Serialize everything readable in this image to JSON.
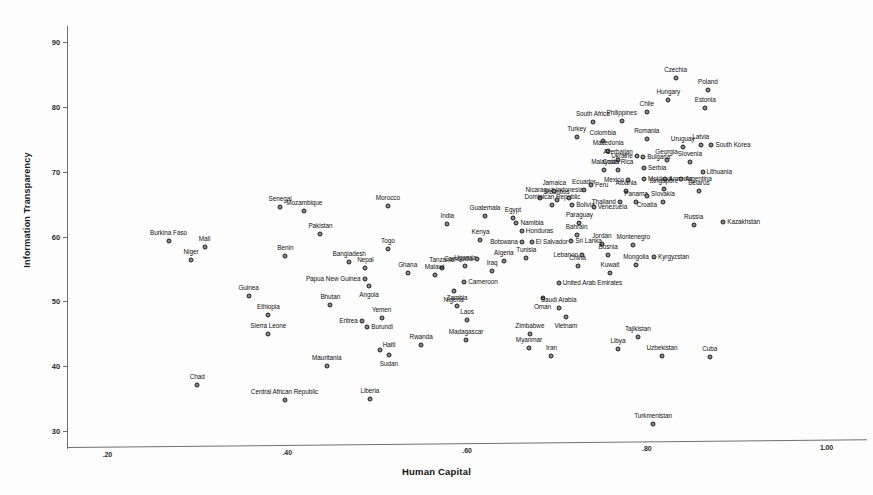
{
  "chart_data": {
    "type": "scatter",
    "title": "",
    "xlabel": "Human Capital",
    "ylabel": "Information Transparency",
    "xlim": [
      0.155,
      1.045
    ],
    "ylim": [
      27.5,
      92.5
    ],
    "xticks": [
      ".20",
      ".40",
      ".60",
      ".80",
      "1.00"
    ],
    "xtick_values": [
      0.2,
      0.4,
      0.6,
      0.8,
      1.0
    ],
    "yticks": [
      "90",
      "80",
      "70",
      "60",
      "50",
      "40",
      "30"
    ],
    "ytick_values": [
      90,
      80,
      70,
      60,
      50,
      40,
      30
    ],
    "grid": false,
    "legend": "none",
    "marker": "circle-filled-gray",
    "points": [
      {
        "label": "Burkina Faso",
        "x": 0.268,
        "y": 59.3,
        "pos": "top"
      },
      {
        "label": "Mali",
        "x": 0.308,
        "y": 58.4,
        "pos": "top"
      },
      {
        "label": "Niger",
        "x": 0.293,
        "y": 56.3,
        "pos": "top"
      },
      {
        "label": "Chad",
        "x": 0.3,
        "y": 37.0,
        "pos": "top"
      },
      {
        "label": "Guinea",
        "x": 0.357,
        "y": 50.8,
        "pos": "top"
      },
      {
        "label": "Ethiopia",
        "x": 0.379,
        "y": 47.9,
        "pos": "top"
      },
      {
        "label": "Sierra Leone",
        "x": 0.379,
        "y": 45.0,
        "pos": "top"
      },
      {
        "label": "Senegal",
        "x": 0.392,
        "y": 64.5,
        "pos": "top"
      },
      {
        "label": "Benin",
        "x": 0.398,
        "y": 57.0,
        "pos": "top"
      },
      {
        "label": "Central African Republic",
        "x": 0.397,
        "y": 34.8,
        "pos": "top"
      },
      {
        "label": "Mozambique",
        "x": 0.419,
        "y": 63.9,
        "pos": "top"
      },
      {
        "label": "Pakistan",
        "x": 0.437,
        "y": 60.4,
        "pos": "top"
      },
      {
        "label": "Mauritania",
        "x": 0.444,
        "y": 40.0,
        "pos": "top"
      },
      {
        "label": "Bhutan",
        "x": 0.448,
        "y": 49.4,
        "pos": "top"
      },
      {
        "label": "Papua New Guinea",
        "x": 0.486,
        "y": 53.5,
        "pos": "left"
      },
      {
        "label": "Bangladesh",
        "x": 0.469,
        "y": 56.0,
        "pos": "top"
      },
      {
        "label": "Nepal",
        "x": 0.487,
        "y": 55.1,
        "pos": "top"
      },
      {
        "label": "Eritrea",
        "x": 0.483,
        "y": 46.9,
        "pos": "left"
      },
      {
        "label": "Burundi",
        "x": 0.489,
        "y": 46.0,
        "pos": "right"
      },
      {
        "label": "Angola",
        "x": 0.491,
        "y": 52.3,
        "pos": "bottom"
      },
      {
        "label": "Liberia",
        "x": 0.492,
        "y": 34.9,
        "pos": "top"
      },
      {
        "label": "Yemen",
        "x": 0.505,
        "y": 47.4,
        "pos": "top"
      },
      {
        "label": "Haiti",
        "x": 0.503,
        "y": 42.5,
        "pos": "topright"
      },
      {
        "label": "Sudan",
        "x": 0.513,
        "y": 41.7,
        "pos": "bottom"
      },
      {
        "label": "Togo",
        "x": 0.512,
        "y": 58.0,
        "pos": "top"
      },
      {
        "label": "Morocco",
        "x": 0.512,
        "y": 64.7,
        "pos": "top"
      },
      {
        "label": "Ghana",
        "x": 0.534,
        "y": 54.3,
        "pos": "top"
      },
      {
        "label": "Rwanda",
        "x": 0.549,
        "y": 43.2,
        "pos": "top"
      },
      {
        "label": "Tanzania",
        "x": 0.572,
        "y": 55.1,
        "pos": "top"
      },
      {
        "label": "Malawi",
        "x": 0.564,
        "y": 54.1,
        "pos": "top"
      },
      {
        "label": "India",
        "x": 0.578,
        "y": 62.0,
        "pos": "top"
      },
      {
        "label": "Nigeria",
        "x": 0.585,
        "y": 51.6,
        "pos": "bottom"
      },
      {
        "label": "Zambia",
        "x": 0.589,
        "y": 49.3,
        "pos": "top"
      },
      {
        "label": "Uganda",
        "x": 0.598,
        "y": 55.4,
        "pos": "top"
      },
      {
        "label": "Cameroon",
        "x": 0.597,
        "y": 53.0,
        "pos": "right"
      },
      {
        "label": "Laos",
        "x": 0.6,
        "y": 47.1,
        "pos": "top"
      },
      {
        "label": "Madagascar",
        "x": 0.599,
        "y": 44.0,
        "pos": "top"
      },
      {
        "label": "Cambodia",
        "x": 0.611,
        "y": 56.6,
        "pos": "left"
      },
      {
        "label": "Kenya",
        "x": 0.615,
        "y": 59.4,
        "pos": "top"
      },
      {
        "label": "Guatemala",
        "x": 0.62,
        "y": 63.2,
        "pos": "top"
      },
      {
        "label": "Iraq",
        "x": 0.628,
        "y": 54.7,
        "pos": "top"
      },
      {
        "label": "Algeria",
        "x": 0.641,
        "y": 56.2,
        "pos": "top"
      },
      {
        "label": "Namibia",
        "x": 0.655,
        "y": 62.1,
        "pos": "right"
      },
      {
        "label": "Egypt",
        "x": 0.651,
        "y": 62.9,
        "pos": "top"
      },
      {
        "label": "Honduras",
        "x": 0.661,
        "y": 60.8,
        "pos": "right"
      },
      {
        "label": "Botswana",
        "x": 0.661,
        "y": 59.2,
        "pos": "left"
      },
      {
        "label": "El Salvador",
        "x": 0.672,
        "y": 59.1,
        "pos": "right"
      },
      {
        "label": "Tunisia",
        "x": 0.666,
        "y": 56.7,
        "pos": "top"
      },
      {
        "label": "Zimbabwe",
        "x": 0.67,
        "y": 45.0,
        "pos": "top"
      },
      {
        "label": "Myanmar",
        "x": 0.669,
        "y": 42.8,
        "pos": "top"
      },
      {
        "label": "Oman",
        "x": 0.684,
        "y": 50.5,
        "pos": "bottom"
      },
      {
        "label": "Nicaragua",
        "x": 0.681,
        "y": 66.0,
        "pos": "top"
      },
      {
        "label": "Dominican Republic",
        "x": 0.695,
        "y": 64.8,
        "pos": "top"
      },
      {
        "label": "Mauritius",
        "x": 0.7,
        "y": 65.6,
        "pos": "top"
      },
      {
        "label": "Jamaica",
        "x": 0.697,
        "y": 67.1,
        "pos": "top"
      },
      {
        "label": "Iran",
        "x": 0.694,
        "y": 41.6,
        "pos": "top"
      },
      {
        "label": "Saudi Arabia",
        "x": 0.702,
        "y": 48.9,
        "pos": "top"
      },
      {
        "label": "United Arab Emirates",
        "x": 0.702,
        "y": 52.8,
        "pos": "right"
      },
      {
        "label": "Vietnam",
        "x": 0.71,
        "y": 47.5,
        "pos": "bottom"
      },
      {
        "label": "Indonesia",
        "x": 0.714,
        "y": 66.0,
        "pos": "top"
      },
      {
        "label": "Bolivia",
        "x": 0.717,
        "y": 64.8,
        "pos": "right"
      },
      {
        "label": "Sri Lanka",
        "x": 0.716,
        "y": 59.3,
        "pos": "right"
      },
      {
        "label": "Paraguay",
        "x": 0.725,
        "y": 62.1,
        "pos": "top"
      },
      {
        "label": "Bahrain",
        "x": 0.722,
        "y": 60.3,
        "pos": "top"
      },
      {
        "label": "China",
        "x": 0.723,
        "y": 55.5,
        "pos": "top"
      },
      {
        "label": "Lebanon",
        "x": 0.728,
        "y": 57.2,
        "pos": "left"
      },
      {
        "label": "Ecuador",
        "x": 0.73,
        "y": 67.2,
        "pos": "top"
      },
      {
        "label": "Peru",
        "x": 0.738,
        "y": 68.0,
        "pos": "right"
      },
      {
        "label": "Venezuela",
        "x": 0.741,
        "y": 64.5,
        "pos": "right"
      },
      {
        "label": "Turkey",
        "x": 0.722,
        "y": 75.4,
        "pos": "top"
      },
      {
        "label": "South Africa",
        "x": 0.74,
        "y": 77.7,
        "pos": "top"
      },
      {
        "label": "Colombia",
        "x": 0.751,
        "y": 74.7,
        "pos": "top"
      },
      {
        "label": "Macedonia",
        "x": 0.757,
        "y": 73.2,
        "pos": "top"
      },
      {
        "label": "Malaysia",
        "x": 0.752,
        "y": 70.2,
        "pos": "top"
      },
      {
        "label": "Jordan",
        "x": 0.75,
        "y": 58.9,
        "pos": "top"
      },
      {
        "label": "Bosnia",
        "x": 0.757,
        "y": 57.1,
        "pos": "top"
      },
      {
        "label": "Kuwait",
        "x": 0.759,
        "y": 54.3,
        "pos": "top"
      },
      {
        "label": "Philippines",
        "x": 0.772,
        "y": 77.8,
        "pos": "top"
      },
      {
        "label": "Azerbaijan",
        "x": 0.768,
        "y": 71.8,
        "pos": "top"
      },
      {
        "label": "Costa Rica",
        "x": 0.768,
        "y": 70.3,
        "pos": "top"
      },
      {
        "label": "Mexico",
        "x": 0.779,
        "y": 68.7,
        "pos": "left"
      },
      {
        "label": "Thailand",
        "x": 0.77,
        "y": 65.4,
        "pos": "left"
      },
      {
        "label": "Albania",
        "x": 0.777,
        "y": 67.0,
        "pos": "top"
      },
      {
        "label": "Montenegro",
        "x": 0.785,
        "y": 58.7,
        "pos": "top"
      },
      {
        "label": "Mongolia",
        "x": 0.788,
        "y": 55.6,
        "pos": "top"
      },
      {
        "label": "Tajikistan",
        "x": 0.79,
        "y": 44.5,
        "pos": "top"
      },
      {
        "label": "Libya",
        "x": 0.768,
        "y": 42.6,
        "pos": "top"
      },
      {
        "label": "Chile",
        "x": 0.8,
        "y": 79.2,
        "pos": "top"
      },
      {
        "label": "Romania",
        "x": 0.8,
        "y": 75.1,
        "pos": "top"
      },
      {
        "label": "Ukraine",
        "x": 0.789,
        "y": 72.4,
        "pos": "left"
      },
      {
        "label": "Bulgaria",
        "x": 0.796,
        "y": 72.2,
        "pos": "right"
      },
      {
        "label": "Serbia",
        "x": 0.797,
        "y": 70.6,
        "pos": "right"
      },
      {
        "label": "Moldova",
        "x": 0.797,
        "y": 68.9,
        "pos": "right"
      },
      {
        "label": "Panama",
        "x": 0.788,
        "y": 65.3,
        "pos": "top"
      },
      {
        "label": "Croatia",
        "x": 0.8,
        "y": 66.3,
        "pos": "bottom"
      },
      {
        "label": "Kyrgyzstan",
        "x": 0.808,
        "y": 56.8,
        "pos": "right"
      },
      {
        "label": "Hungary",
        "x": 0.824,
        "y": 81.1,
        "pos": "top"
      },
      {
        "label": "Czechia",
        "x": 0.832,
        "y": 84.4,
        "pos": "top"
      },
      {
        "label": "Georgia",
        "x": 0.822,
        "y": 71.8,
        "pos": "top"
      },
      {
        "label": "Armenia",
        "x": 0.82,
        "y": 68.9,
        "pos": "right"
      },
      {
        "label": "Slovakia",
        "x": 0.818,
        "y": 65.3,
        "pos": "top"
      },
      {
        "label": "Singapore",
        "x": 0.819,
        "y": 67.3,
        "pos": "top"
      },
      {
        "label": "Uruguay",
        "x": 0.84,
        "y": 73.8,
        "pos": "top"
      },
      {
        "label": "Argentina",
        "x": 0.838,
        "y": 68.9,
        "pos": "right"
      },
      {
        "label": "Slovenia",
        "x": 0.848,
        "y": 71.5,
        "pos": "top"
      },
      {
        "label": "Estonia",
        "x": 0.865,
        "y": 79.9,
        "pos": "top"
      },
      {
        "label": "Poland",
        "x": 0.868,
        "y": 82.6,
        "pos": "top"
      },
      {
        "label": "Latvia",
        "x": 0.86,
        "y": 74.2,
        "pos": "top"
      },
      {
        "label": "South Korea",
        "x": 0.872,
        "y": 74.1,
        "pos": "right"
      },
      {
        "label": "Lithuania",
        "x": 0.862,
        "y": 70.0,
        "pos": "right"
      },
      {
        "label": "Belarus",
        "x": 0.858,
        "y": 67.0,
        "pos": "top"
      },
      {
        "label": "Russia",
        "x": 0.852,
        "y": 61.7,
        "pos": "top"
      },
      {
        "label": "Kazakhstan",
        "x": 0.885,
        "y": 62.3,
        "pos": "right"
      },
      {
        "label": "Uzbekistan",
        "x": 0.817,
        "y": 41.5,
        "pos": "top"
      },
      {
        "label": "Cuba",
        "x": 0.87,
        "y": 41.4,
        "pos": "top"
      },
      {
        "label": "Turkmenistan",
        "x": 0.807,
        "y": 31.0,
        "pos": "top"
      }
    ]
  }
}
